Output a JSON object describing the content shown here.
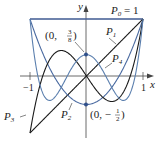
{
  "chart_data": {
    "type": "line",
    "title": "",
    "xlabel": "x",
    "ylabel": "y",
    "xlim": [
      -1,
      1
    ],
    "ylim": [
      -1,
      1
    ],
    "x_ticks": [
      "-1",
      "1"
    ],
    "grid": false,
    "series": [
      {
        "name": "P0",
        "label": "P_0 = 1",
        "formula": "1",
        "color": "#3f5a92"
      },
      {
        "name": "P1",
        "label": "P_1",
        "formula": "x",
        "color": "#1a1a1a"
      },
      {
        "name": "P2",
        "label": "P_2",
        "formula": "(3x^2-1)/2",
        "color": "#4a6aa0"
      },
      {
        "name": "P3",
        "label": "P_3",
        "formula": "(5x^3-3x)/2",
        "color": "#1a1a1a"
      },
      {
        "name": "P4",
        "label": "P_4",
        "formula": "(35x^4-30x^2+3)/8",
        "color": "#5b7fae"
      }
    ],
    "annotations": [
      {
        "text": "(0, 3/8)",
        "point": [
          0,
          0.375
        ]
      },
      {
        "text": "(0, -1/2)",
        "point": [
          0,
          -0.5
        ]
      }
    ]
  },
  "labels": {
    "y_axis": "y",
    "x_axis": "x",
    "tick_neg1": "−1",
    "tick_pos1": "1",
    "p0": "P",
    "p0_sub": "0",
    "p0_eq": " = 1",
    "p1": "P",
    "p1_sub": "1",
    "p2": "P",
    "p2_sub": "2",
    "p3": "P",
    "p3_sub": "3",
    "p4": "P",
    "p4_sub": "4",
    "ann_top_prefix": "(0, ",
    "ann_top_num": "3",
    "ann_top_den": "8",
    "ann_top_suffix": ")",
    "ann_bot_prefix": "(0, −",
    "ann_bot_num": "1",
    "ann_bot_den": "2",
    "ann_bot_suffix": ")"
  }
}
